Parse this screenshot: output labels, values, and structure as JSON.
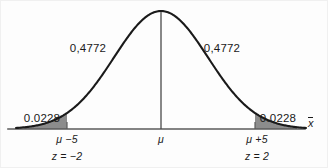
{
  "chart_data": {
    "type": "line",
    "title": "",
    "subtitle": "",
    "xlabel": "x̄",
    "ylabel": "",
    "grid": false,
    "legend": null,
    "distribution": "normal",
    "curve": {
      "mean_x_px": 161,
      "peak_y_px": 11,
      "baseline_y_px": 129,
      "sigma_px": 47,
      "axis_x_start_px": 8,
      "axis_x_end_px": 305
    },
    "annotations": [
      {
        "id": "left-area",
        "text": "0,4772",
        "role": "probability-left-half",
        "x_px": 88,
        "y_px": 43
      },
      {
        "id": "right-area",
        "text": "0,4772",
        "role": "probability-right-half",
        "x_px": 222,
        "y_px": 43
      },
      {
        "id": "left-tail",
        "text": "0.0228",
        "role": "probability-left-tail",
        "x_px": 42,
        "y_px": 113
      },
      {
        "id": "right-tail",
        "text": "0.0228",
        "role": "probability-right-tail",
        "x_px": 278,
        "y_px": 113
      }
    ],
    "ticks": [
      {
        "id": "lower",
        "x_px": 67,
        "value_label": "μ −5",
        "z_label": "z = −2",
        "z_value": -2,
        "shaded": true
      },
      {
        "id": "mean",
        "x_px": 161,
        "value_label": "μ",
        "z_label": "",
        "z_value": 0,
        "shaded": false
      },
      {
        "id": "upper",
        "x_px": 257,
        "value_label": "μ +5",
        "z_label": "z = 2",
        "z_value": 2,
        "shaded": true
      }
    ],
    "shaded_regions": [
      {
        "id": "left-tail-shade",
        "from_x_px": 24,
        "to_x_px": 67,
        "probability": 0.0228,
        "fill": "#8c8c8c"
      },
      {
        "id": "right-tail-shade",
        "from_x_px": 255,
        "to_x_px": 297,
        "probability": 0.0228,
        "fill": "#8c8c8c"
      }
    ],
    "probabilities": {
      "left_half": 0.4772,
      "right_half": 0.4772,
      "left_tail": 0.0228,
      "right_tail": 0.0228
    }
  },
  "figure": {
    "axis_label": "x̄",
    "axis_label_base": "x",
    "mean_symbol": "μ",
    "colors": {
      "background": "#fdfdfd",
      "curve": "#1a1a1a",
      "axis": "#5a5a5a",
      "center_line": "#4a4a4a",
      "shading": "#8c8c8c",
      "text": "#1a1a1a"
    },
    "labels": {
      "left_area": "0,4772",
      "right_area": "0,4772",
      "left_tail": "0.0228",
      "right_tail": "0.0228",
      "lower_tick_value": "μ −5",
      "lower_tick_z": "z = −2",
      "mean_tick_value": "μ",
      "upper_tick_value": "μ +5",
      "upper_tick_z": "z = 2"
    }
  }
}
